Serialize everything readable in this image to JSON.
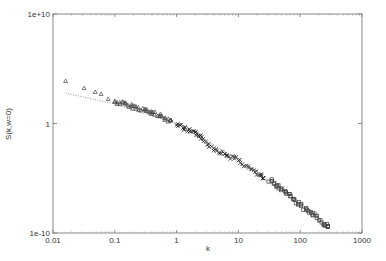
{
  "chart_data": {
    "type": "scatter",
    "title": "",
    "xlabel": "k",
    "ylabel": "S(k,w=0)",
    "xscale": "log",
    "yscale": "log",
    "xlim": [
      0.01,
      1000
    ],
    "ylim": [
      1e-10,
      10000000000.0
    ],
    "x_ticks": [
      "0.01",
      "0.1",
      "1",
      "10",
      "100",
      "1000"
    ],
    "y_ticks": [
      "1e-10",
      "1",
      "1e+10"
    ],
    "grid": false,
    "legend": null,
    "series": [
      {
        "name": "data (triangles)",
        "marker": "triangle",
        "points": [
          [
            0.016,
            7600
          ],
          [
            0.032,
            1700
          ],
          [
            0.048,
            760
          ],
          [
            0.06,
            500
          ],
          [
            0.078,
            170
          ],
          [
            0.1,
            95
          ],
          [
            0.13,
            70
          ],
          [
            0.17,
            45
          ],
          [
            0.22,
            30
          ],
          [
            0.3,
            18
          ],
          [
            0.37,
            11
          ],
          [
            0.45,
            8
          ],
          [
            0.6,
            4
          ],
          [
            0.8,
            2
          ]
        ]
      },
      {
        "name": "data (crosses)",
        "marker": "cross",
        "points": [
          [
            1.0,
            1.0
          ],
          [
            1.3,
            0.4
          ],
          [
            1.6,
            0.2
          ],
          [
            2.0,
            0.12
          ],
          [
            2.4,
            0.09
          ],
          [
            3.0,
            0.02
          ],
          [
            4.0,
            0.005
          ],
          [
            5.5,
            0.002
          ],
          [
            7.0,
            0.001
          ],
          [
            10,
            0.0005
          ],
          [
            14,
            0.0001
          ],
          [
            20,
            3e-05
          ],
          [
            25,
            1e-05
          ]
        ]
      },
      {
        "name": "data (squares)",
        "marker": "square",
        "points": [
          [
            32,
            6e-06
          ],
          [
            40,
            3e-06
          ],
          [
            50,
            1e-06
          ],
          [
            65,
            4e-07
          ],
          [
            80,
            1e-07
          ],
          [
            100,
            4e-08
          ],
          [
            130,
            1e-08
          ],
          [
            170,
            4e-09
          ],
          [
            220,
            1e-09
          ],
          [
            280,
            4e-10
          ]
        ]
      },
      {
        "name": "fit",
        "style": "dotted-line",
        "points": [
          [
            0.016,
            600
          ],
          [
            0.1,
            60
          ],
          [
            1,
            1
          ],
          [
            10,
            0.0005
          ],
          [
            100,
            4e-08
          ],
          [
            280,
            4e-10
          ]
        ]
      }
    ]
  },
  "axes": {
    "x_label": "k",
    "y_label": "S(k,w=0)",
    "x_tick_labels": [
      "0.01",
      "0.1",
      "1",
      "10",
      "100",
      "1000"
    ],
    "y_tick_labels": [
      "1e+10",
      "1",
      "1e-10"
    ]
  }
}
